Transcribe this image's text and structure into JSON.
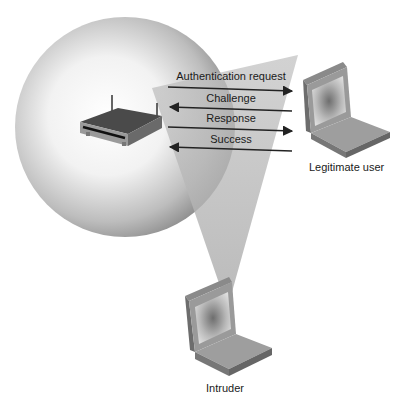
{
  "diagram": {
    "title": "",
    "nodes": {
      "access_point": {
        "label": ""
      },
      "legitimate_user": {
        "label": "Legitimate user"
      },
      "intruder": {
        "label": "Intruder"
      }
    },
    "messages": [
      {
        "label": "Authentication request",
        "direction": "to-user"
      },
      {
        "label": "Challenge",
        "direction": "to-ap"
      },
      {
        "label": "Response",
        "direction": "to-user"
      },
      {
        "label": "Success",
        "direction": "to-ap"
      }
    ]
  },
  "colors": {
    "background": "#ffffff",
    "sphere": "#9a9a9a",
    "beam": "#c8c8c8",
    "arrow": "#222222"
  }
}
